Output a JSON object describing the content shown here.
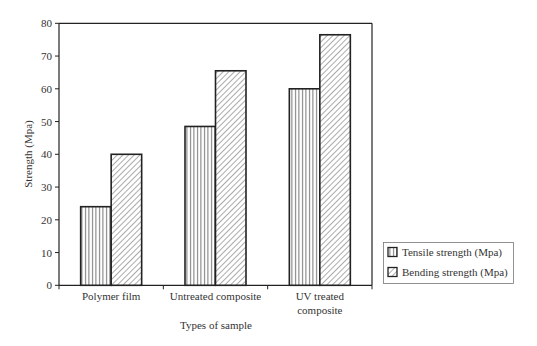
{
  "chart_data": {
    "type": "bar",
    "title": "",
    "xlabel": "Types of sample",
    "ylabel": "Strength (Mpa)",
    "ylim": [
      0,
      80
    ],
    "yticks": [
      0,
      10,
      20,
      30,
      40,
      50,
      60,
      70,
      80
    ],
    "categories": [
      "Polymer film",
      "Untreated composite",
      "UV treated composite"
    ],
    "category_label_lines": [
      [
        "Polymer film"
      ],
      [
        "Untreated composite"
      ],
      [
        "UV treated",
        "composite"
      ]
    ],
    "series": [
      {
        "name": "Tensile strength (Mpa)",
        "pattern": "vertical-lines",
        "values": [
          24,
          48.5,
          60
        ]
      },
      {
        "name": "Bending strength (Mpa)",
        "pattern": "diagonal-lines",
        "values": [
          40,
          65.5,
          76.5
        ]
      }
    ],
    "grid": false,
    "legend_position": "right-bottom"
  },
  "colors": {
    "stroke": "#222222",
    "hatch": "#555555",
    "background": "#ffffff"
  }
}
